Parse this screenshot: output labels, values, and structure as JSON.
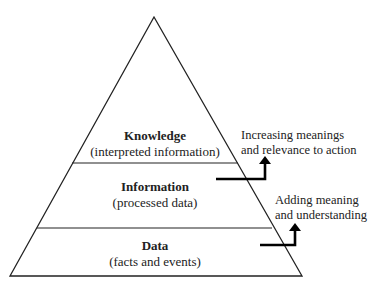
{
  "pyramid": {
    "levels": [
      {
        "title": "Knowledge",
        "subtitle": "(interpreted information)"
      },
      {
        "title": "Information",
        "subtitle": "(processed data)"
      },
      {
        "title": "Data",
        "subtitle": "(facts and events)"
      }
    ]
  },
  "annotations": [
    {
      "line1": "Increasing meanings",
      "line2": "and relevance to action"
    },
    {
      "line1": "Adding meaning",
      "line2": "and understanding"
    }
  ]
}
